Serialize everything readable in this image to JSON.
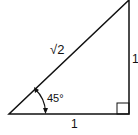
{
  "diagram": {
    "type": "right-triangle",
    "hypotenuse_label": "√2",
    "vertical_leg_label": "1",
    "horizontal_leg_label": "1",
    "angle_label": "45°",
    "right_angle_marker": true,
    "stroke_color": "#111111"
  }
}
